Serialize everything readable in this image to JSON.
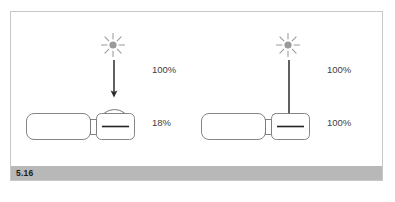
{
  "figure": {
    "caption_number": "5.16",
    "frame_border_color": "#c8c8c8",
    "caption_bar_color": "#b8b8b8",
    "line_color": "#555555",
    "sun_color": "#9a9a9a",
    "arrow_color": "#2b2b2b"
  },
  "panels": [
    {
      "id": "left",
      "name": "left-panel",
      "sun_label": "sun-icon",
      "incoming_label": "100%",
      "outgoing_label": "18%",
      "has_dome": true
    },
    {
      "id": "right",
      "name": "right-panel",
      "sun_label": "sun-icon",
      "incoming_label": "100%",
      "outgoing_label": "100%",
      "has_dome": false
    }
  ],
  "labels": {
    "left_top": "100%",
    "left_bottom": "18%",
    "right_top": "100%",
    "right_bottom": "100%"
  }
}
